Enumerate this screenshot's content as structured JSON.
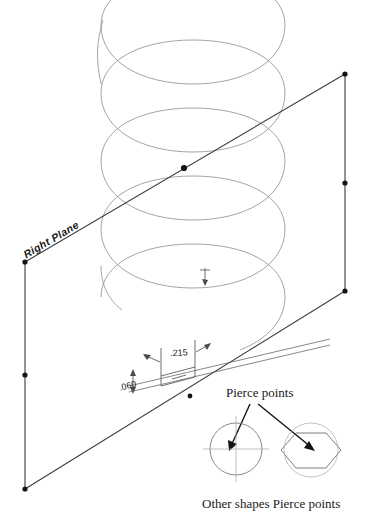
{
  "drawing": {
    "title": "Helix sweep with pierce point reference",
    "colors": {
      "plane_edge": "#3c3c3c",
      "helix": "#8d8d93",
      "dimension": "#4a4a4a",
      "arrow": "#141414",
      "shape_outline": "#7b7b80",
      "hex_outline": "#6f6f74",
      "text": "#1a1a1a",
      "background": "#ffffff",
      "vertex": "#141414"
    }
  },
  "plane": {
    "label": "Right Plane",
    "vertices": [
      {
        "name": "top-left",
        "x": 25,
        "y": 262
      },
      {
        "name": "mid-left",
        "x": 25,
        "y": 375
      },
      {
        "name": "bottom-left",
        "x": 25,
        "y": 489
      },
      {
        "name": "top-right",
        "x": 345,
        "y": 74
      },
      {
        "name": "mid-right",
        "x": 345,
        "y": 183
      },
      {
        "name": "bottom-right",
        "x": 345,
        "y": 291
      }
    ]
  },
  "helix": {
    "coil_count": 5,
    "pierce_point": {
      "x": 184,
      "y": 168
    }
  },
  "origin_marker": {
    "x": 205,
    "y": 272
  },
  "profile": {
    "width_dim": ".215",
    "height_dim": ".060"
  },
  "pierce_callout": {
    "title": "Pierce points",
    "caption": "Other shapes Pierce points",
    "shapes": [
      {
        "name": "circle",
        "cx": 236,
        "cy": 449,
        "r": 26
      },
      {
        "name": "hexagon",
        "cx": 311,
        "cy": 450,
        "r": 30
      }
    ]
  }
}
